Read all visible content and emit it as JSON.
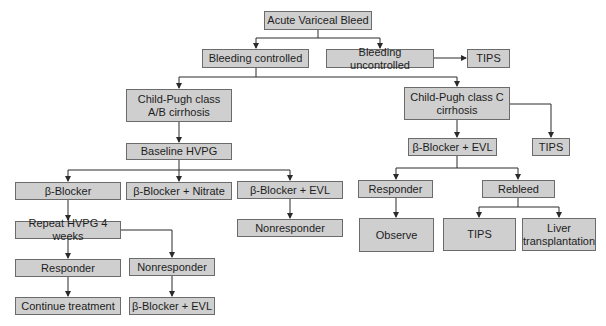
{
  "diagram": {
    "type": "flowchart",
    "colors": {
      "box_fill": "#cfcfcf",
      "box_border": "#6b6b6b",
      "line": "#2a2a2a",
      "text": "#1d1d1d"
    },
    "nodes": {
      "root": "Acute Variceal Bleed",
      "bleeding_controlled": "Bleeding controlled",
      "bleeding_uncontrolled": "Bleeding uncontrolled",
      "tips_top": "TIPS",
      "child_pugh_ab": "Child-Pugh class\nA/B cirrhosis",
      "child_pugh_c": "Child-Pugh class C\ncirrhosis",
      "tips_c": "TIPS",
      "baseline_hvpg": "Baseline HVPG",
      "beta_blocker": "β-Blocker",
      "beta_blocker_nitrate": "β-Blocker + Nitrate",
      "beta_blocker_evl_ab": "β-Blocker + EVL",
      "nonresponder_evl": "Nonresponder",
      "repeat_hvpg": "Repeat HVPG 4 weeks",
      "responder_ab": "Responder",
      "nonresponder_ab": "Nonresponder",
      "continue_treatment": "Continue treatment",
      "beta_blocker_evl_final": "β-Blocker + EVL",
      "beta_blocker_evl_c": "β-Blocker + EVL",
      "responder_c": "Responder",
      "rebleed": "Rebleed",
      "observe": "Observe",
      "tips_rebleed": "TIPS",
      "liver_transplantation": "Liver\ntransplantation"
    }
  }
}
